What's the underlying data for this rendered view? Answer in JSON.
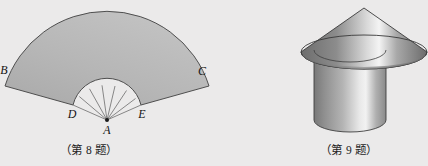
{
  "page": {
    "background_color": "#ebeaea",
    "width": 428,
    "height": 166
  },
  "figures": [
    {
      "id": "fan-sector",
      "name": "annular-sector-fan",
      "caption": "（第 8 题）",
      "fill_color": "#b4b4b4",
      "stroke_color": "#4a4a4a",
      "labels": {
        "A": "A",
        "B": "B",
        "C": "C",
        "D": "D",
        "E": "E"
      }
    },
    {
      "id": "cone-on-cylinder",
      "name": "cone-on-cylinder-solid",
      "caption": "（第 9 题）",
      "cone_fill_dark": "#6f6f6f",
      "cone_fill_light": "#f2f2f2",
      "cylinder_fill_dark": "#7a7a7a",
      "cylinder_fill_light": "#efefef",
      "stroke_color": "#3c3c3c"
    }
  ]
}
